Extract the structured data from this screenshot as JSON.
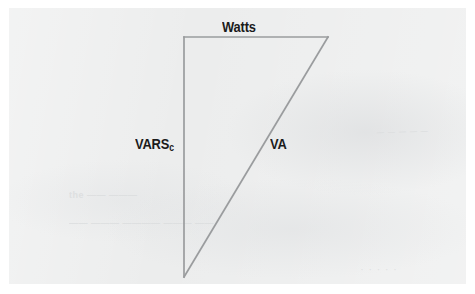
{
  "figure": {
    "kind": "power-triangle",
    "background_color": "#eceded",
    "page_color": "#ffffff",
    "line_color": "#9a9c9e",
    "text_color": "#1b1b1b",
    "labels": {
      "adjacent": "Watts",
      "opposite_main": "VARS",
      "opposite_subscript": "c",
      "hypotenuse": "VA"
    },
    "vertices": {
      "top_left": {
        "x": 184,
        "y": 37
      },
      "top_right": {
        "x": 328,
        "y": 37
      },
      "bottom_left": {
        "x": 184,
        "y": 277
      }
    },
    "ghost_text": {
      "a": "— — — — —",
      "b": "the —— ———",
      "c": "—— ——— ———— ——— ——",
      "d": "· · · · ·"
    }
  }
}
